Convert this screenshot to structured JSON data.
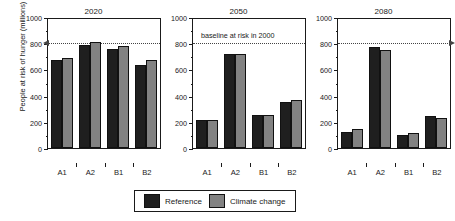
{
  "chart_data": {
    "type": "bar",
    "title": "",
    "ylabel": "People at risk of hunger (millions)",
    "xlabel": "",
    "ylim": [
      0,
      1000
    ],
    "yticks": [
      0,
      200,
      400,
      600,
      800,
      1000
    ],
    "ytick_labels": [
      "0",
      "200",
      "400",
      "600",
      "800",
      "1000"
    ],
    "grid": false,
    "categories": [
      "A1",
      "A2",
      "B1",
      "B2"
    ],
    "legend_position": "bottom-center",
    "annotation": {
      "text": "baseline at risk in 2000",
      "value": 820
    },
    "panels": [
      {
        "title": "2020",
        "categories": [
          "A1",
          "A2",
          "B1",
          "B2"
        ],
        "series": [
          {
            "name": "Reference",
            "color": "#1f1f1f",
            "values": [
              670,
              785,
              755,
              635
            ]
          },
          {
            "name": "Climate change",
            "color": "#828282",
            "values": [
              690,
              810,
              780,
              670
            ]
          }
        ]
      },
      {
        "title": "2050",
        "categories": [
          "A1",
          "A2",
          "B1",
          "B2"
        ],
        "series": [
          {
            "name": "Reference",
            "color": "#1f1f1f",
            "values": [
              215,
              720,
              250,
              355
            ]
          },
          {
            "name": "Climate change",
            "color": "#828282",
            "values": [
              215,
              720,
              250,
              370
            ]
          }
        ]
      },
      {
        "title": "2080",
        "categories": [
          "A1",
          "A2",
          "B1",
          "B2"
        ],
        "series": [
          {
            "name": "Reference",
            "color": "#1f1f1f",
            "values": [
              120,
              770,
              100,
              245
            ]
          },
          {
            "name": "Climate change",
            "color": "#828282",
            "values": [
              148,
              745,
              115,
              230
            ]
          }
        ]
      }
    ],
    "legend": [
      {
        "label": "Reference",
        "color": "#1f1f1f"
      },
      {
        "label": "Climate change",
        "color": "#828282"
      }
    ]
  }
}
